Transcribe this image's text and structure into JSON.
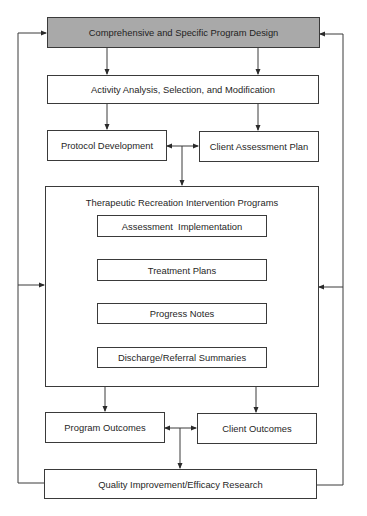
{
  "diagram": {
    "nodes": {
      "program_design": "Comprehensive and Specific Program Design",
      "activity_analysis": "Activity Analysis, Selection, and Modification",
      "protocol_development": "Protocol Development",
      "client_assessment_plan": "Client Assessment Plan",
      "tr_intervention_programs": "Therapeutic Recreation Intervention Programs",
      "assessment_implementation": "Assessment  Implementation",
      "treatment_plans": "Treatment Plans",
      "progress_notes": "Progress Notes",
      "discharge_summaries": "Discharge/Referral Summaries",
      "program_outcomes": "Program Outcomes",
      "client_outcomes": "Client Outcomes",
      "quality_improvement": "Quality Improvement/Efficacy Research"
    },
    "colors": {
      "shaded_fill": "#a9a9a9",
      "line": "#3a3a3a",
      "background": "#ffffff"
    },
    "edges": [
      {
        "from": "program_design",
        "to": "activity_analysis",
        "count": 2
      },
      {
        "from": "activity_analysis",
        "to": "protocol_development"
      },
      {
        "from": "activity_analysis",
        "to": "client_assessment_plan"
      },
      {
        "from": "protocol_development",
        "to": "client_assessment_plan",
        "bidirectional": true
      },
      {
        "from": "protocol_development|client_assessment_plan",
        "to": "tr_intervention_programs"
      },
      {
        "from": "assessment_implementation",
        "to": "treatment_plans"
      },
      {
        "from": "treatment_plans",
        "to": "progress_notes"
      },
      {
        "from": "progress_notes",
        "to": "discharge_summaries"
      },
      {
        "from": "tr_intervention_programs",
        "to": "program_outcomes"
      },
      {
        "from": "tr_intervention_programs",
        "to": "client_outcomes"
      },
      {
        "from": "program_outcomes",
        "to": "client_outcomes",
        "bidirectional": true
      },
      {
        "from": "program_outcomes|client_outcomes",
        "to": "quality_improvement"
      },
      {
        "from": "quality_improvement",
        "to": "program_design",
        "side": "left"
      },
      {
        "from": "quality_improvement",
        "to": "program_design",
        "side": "right"
      },
      {
        "from": "quality_improvement",
        "to": "tr_intervention_programs",
        "side": "left"
      },
      {
        "from": "quality_improvement",
        "to": "tr_intervention_programs",
        "side": "right"
      }
    ]
  }
}
